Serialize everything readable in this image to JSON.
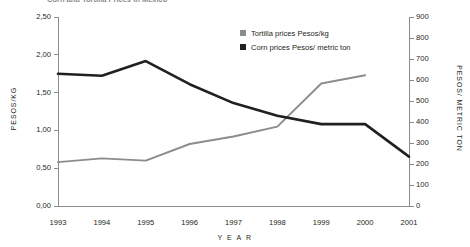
{
  "title": "Corn and Tortilla Prices in Mexico",
  "legend": {
    "position": "top-right",
    "items": [
      {
        "label": "Tortilla prices Pesos/kg",
        "color": "#8c8c8c"
      },
      {
        "label": "Corn prices Pesos/ metric ton",
        "color": "#231f20"
      }
    ]
  },
  "axes": {
    "x_title": "Y E A R",
    "y_left_title": "PESOS/KG",
    "y_right_title": "PESOS/ METRIC TON",
    "y_left_ticks": [
      "0,00",
      "0,50",
      "1,00",
      "1,50",
      "2,00",
      "2,50"
    ],
    "y_right_ticks": [
      "0",
      "100",
      "200",
      "300",
      "400",
      "500",
      "600",
      "700",
      "800",
      "900"
    ]
  },
  "chart_data": {
    "type": "line",
    "title": "Corn and Tortilla Prices in Mexico",
    "xlabel": "YEAR",
    "ylabel": "PESOS/KG",
    "y2label": "PESOS/ METRIC TON",
    "grid": false,
    "legend_position": "top-right",
    "categories": [
      "1993",
      "1994",
      "1995",
      "1996",
      "1997",
      "1998",
      "1999",
      "2000",
      "2001"
    ],
    "xlim": [
      1993,
      2001
    ],
    "ylim": [
      0,
      2.5
    ],
    "y2lim": [
      0,
      900
    ],
    "series": [
      {
        "name": "Tortilla prices Pesos/kg",
        "axis": "left",
        "color": "#8c8c8c",
        "values": [
          0.58,
          0.63,
          0.6,
          0.82,
          0.92,
          1.05,
          1.62,
          1.73,
          null
        ]
      },
      {
        "name": "Corn prices Pesos/ metric ton",
        "axis": "right",
        "color": "#231f20",
        "values": [
          630,
          620,
          690,
          580,
          490,
          430,
          390,
          390,
          235
        ]
      }
    ]
  }
}
